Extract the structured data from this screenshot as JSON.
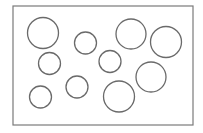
{
  "diagram": {
    "frame": {
      "x": 13,
      "y": 6,
      "width": 180,
      "height": 119,
      "stroke": "#7a7a7a"
    },
    "circle_stroke": "#6a6a6a",
    "circles": [
      {
        "cx": 43,
        "cy": 33,
        "r": 15.5
      },
      {
        "cx": 85.5,
        "cy": 43,
        "r": 11
      },
      {
        "cx": 131,
        "cy": 34,
        "r": 15
      },
      {
        "cx": 166,
        "cy": 42,
        "r": 15.5
      },
      {
        "cx": 49.5,
        "cy": 63.5,
        "r": 11
      },
      {
        "cx": 110,
        "cy": 61.5,
        "r": 11
      },
      {
        "cx": 151,
        "cy": 77,
        "r": 15
      },
      {
        "cx": 77,
        "cy": 87,
        "r": 11
      },
      {
        "cx": 40.5,
        "cy": 97,
        "r": 11
      },
      {
        "cx": 119,
        "cy": 96.5,
        "r": 15.5
      }
    ],
    "count": 10
  }
}
